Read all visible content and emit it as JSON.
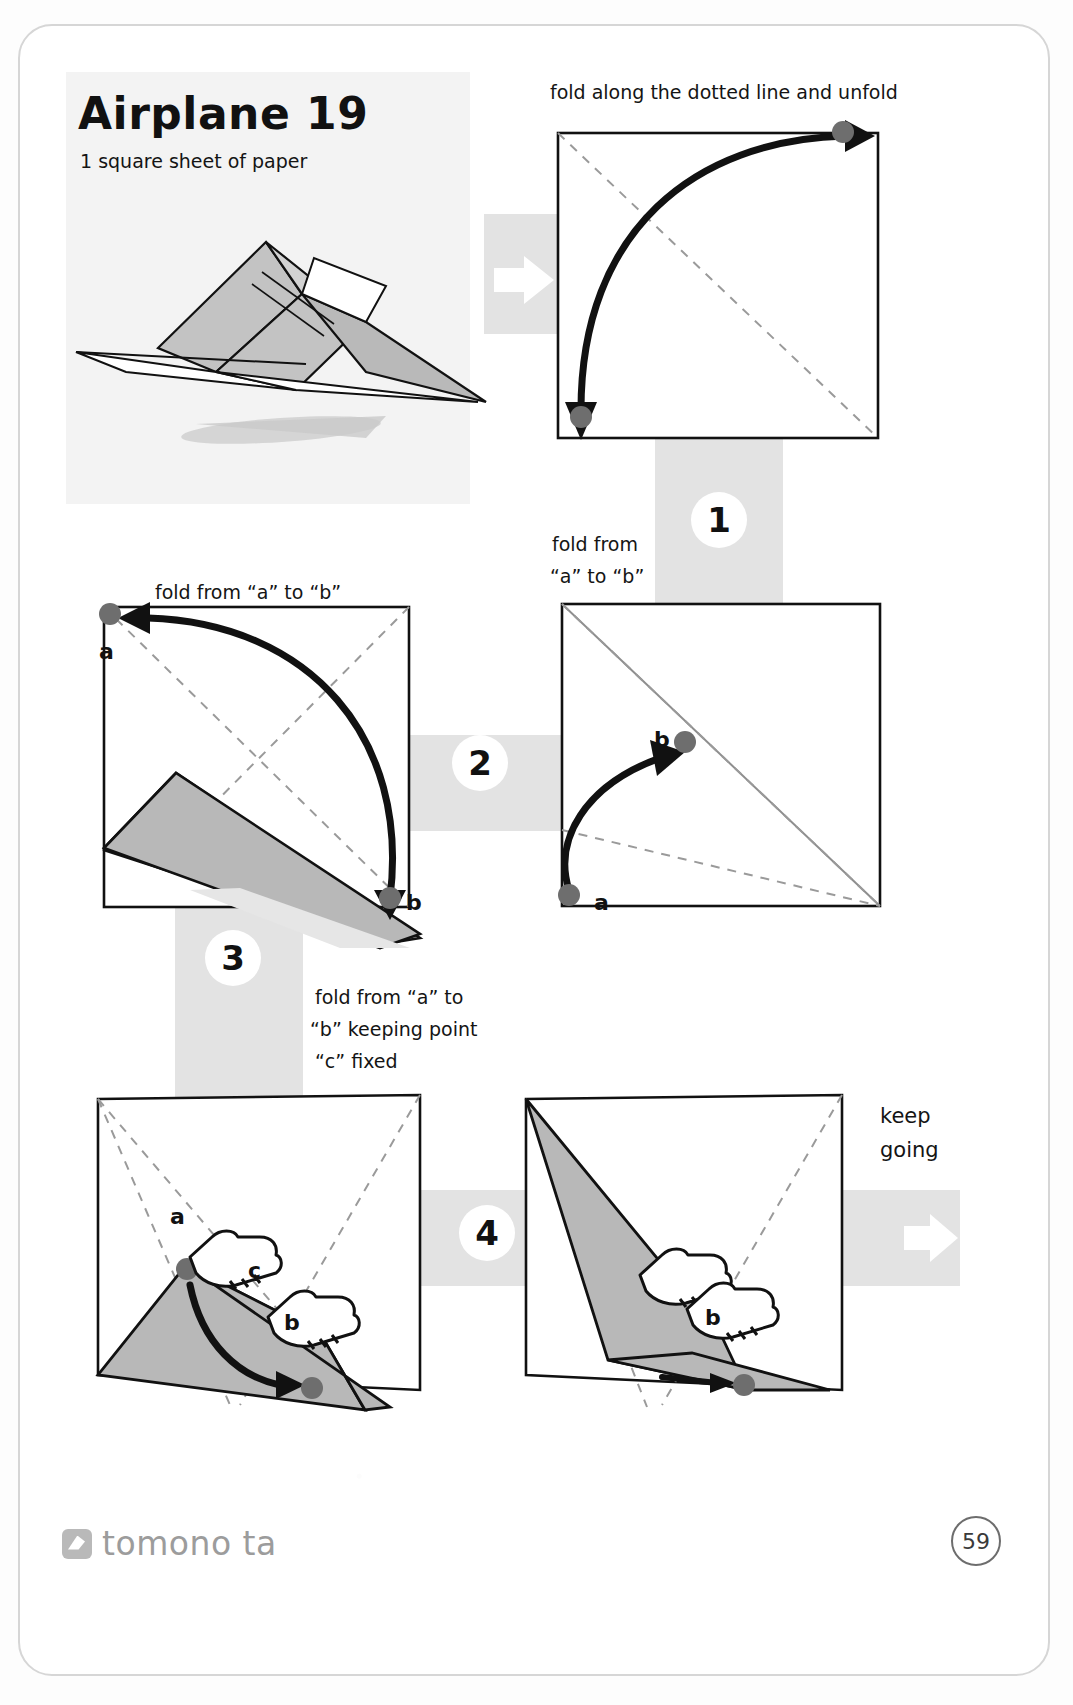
{
  "page": {
    "title": "Airplane 19",
    "subtitle": "1 square sheet of paper",
    "page_number": "59",
    "brand": "tomono ta",
    "keep_going_line1": "keep",
    "keep_going_line2": "going",
    "band_color": "#e3e3e3",
    "paper_fill": "#b8b8b8",
    "dot_color": "#6e6e6e",
    "ink_color": "#111111"
  },
  "photo": {
    "alt": "finished paper airplane model"
  },
  "steps": [
    {
      "number": "1",
      "caption": "fold along the dotted line and unfold",
      "point_labels": []
    },
    {
      "number": "2",
      "caption_line1": "fold from",
      "caption_line2": "“a” to “b”",
      "point_labels": [
        "a",
        "b"
      ]
    },
    {
      "number": "3",
      "caption": "fold from “a” to “b”",
      "point_labels": [
        "a",
        "b"
      ]
    },
    {
      "number": "4",
      "caption_line1": "fold from “a” to",
      "caption_line2": "“b” keeping point",
      "caption_line3": "“c” fixed",
      "point_labels": [
        "a",
        "b",
        "c"
      ]
    }
  ],
  "labels": {
    "s2_a": "a",
    "s2_b": "b",
    "s3_a": "a",
    "s3_b": "b",
    "s4_a": "a",
    "s4_b": "b",
    "s4_c": "c",
    "s5_b": "b"
  },
  "icons": {
    "next_arrow": "right-arrow-icon",
    "hand": "pointing-hand-icon"
  }
}
